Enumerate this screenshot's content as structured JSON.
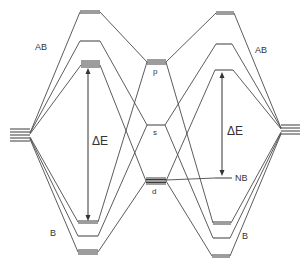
{
  "diagram": {
    "type": "molecular-orbital-energy-level-diagram",
    "labels": {
      "left_antibonding": "AB",
      "left_bonding": "B",
      "right_antibonding": "AB",
      "right_bonding": "B",
      "left_gap": "ΔE",
      "right_gap": "ΔE",
      "nonbonding": "NB",
      "center_p": "p",
      "center_s": "s",
      "center_d": "d"
    },
    "colors": {
      "line": "#4a4a4a",
      "text": "#333333",
      "background": "#ffffff"
    },
    "center_levels": [
      {
        "name": "p",
        "x1": 147,
        "x2": 166,
        "y": 62,
        "lines": 3
      },
      {
        "name": "s",
        "x1": 147,
        "x2": 165,
        "y": 125,
        "lines": 1
      },
      {
        "name": "d",
        "x1": 146,
        "x2": 166,
        "y": 180,
        "lines": 5
      }
    ],
    "left_stack": {
      "x1": 10,
      "x2": 30,
      "y": 135,
      "lines": 5
    },
    "right_stack": {
      "x1": 281,
      "x2": 300,
      "y": 130,
      "lines": 4
    },
    "left_levels": [
      {
        "name": "AB1",
        "x1": 80,
        "x2": 100,
        "y": 12
      },
      {
        "name": "AB2",
        "x1": 80,
        "x2": 100,
        "y": 41
      },
      {
        "name": "AB3",
        "x1": 81,
        "x2": 100,
        "y": 65
      },
      {
        "name": "B1",
        "x1": 78,
        "x2": 98,
        "y": 222
      },
      {
        "name": "B2",
        "x1": 78,
        "x2": 98,
        "y": 236
      },
      {
        "name": "B3",
        "x1": 78,
        "x2": 98,
        "y": 252
      }
    ],
    "right_levels": [
      {
        "name": "AB1",
        "x1": 216,
        "x2": 234,
        "y": 13
      },
      {
        "name": "AB2",
        "x1": 216,
        "x2": 232,
        "y": 44
      },
      {
        "name": "AB3",
        "x1": 215,
        "x2": 233,
        "y": 70
      },
      {
        "name": "NB",
        "x1": 215,
        "x2": 232,
        "y": 178
      },
      {
        "name": "B1",
        "x1": 213,
        "x2": 231,
        "y": 223
      },
      {
        "name": "B2",
        "x1": 213,
        "x2": 230,
        "y": 238
      },
      {
        "name": "B3",
        "x1": 212,
        "x2": 230,
        "y": 256
      }
    ]
  }
}
